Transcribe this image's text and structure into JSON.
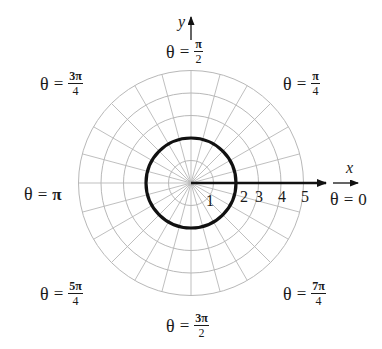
{
  "diagram": {
    "type": "polar-grid",
    "center": {
      "x": 191,
      "y": 183
    },
    "unit_px": 22.5,
    "grid_radii": [
      1,
      2,
      3,
      4,
      5
    ],
    "radial_line_step_deg": 15,
    "grid_color": "#b8b8b8",
    "curve": {
      "name": "circle",
      "equation": "r = 2",
      "radius": 2,
      "color": "#111111",
      "stroke_width": 3.2
    },
    "ray": {
      "from_r": 0,
      "to_x": 326,
      "color": "#111111",
      "stroke_width": 2.6
    },
    "axes": {
      "x": {
        "label": "x",
        "arrow_from": 333,
        "arrow_to": 358
      },
      "y": {
        "label": "y",
        "arrow_from": 40,
        "arrow_to": 17
      }
    },
    "tick_labels": [
      {
        "text": "1",
        "x": 206,
        "y": 193
      },
      {
        "text": "2",
        "x": 240,
        "y": 189
      },
      {
        "text": "3",
        "x": 255,
        "y": 189
      },
      {
        "text": "4",
        "x": 278,
        "y": 189
      },
      {
        "text": "5",
        "x": 301,
        "y": 189
      }
    ]
  },
  "angle_labels": [
    {
      "id": "theta-pi-over-2",
      "theta": "θ",
      "eq": "=",
      "type": "frac",
      "num": "π",
      "den": "2",
      "x": 166,
      "y": 38
    },
    {
      "id": "theta-pi-over-4",
      "theta": "θ",
      "eq": "=",
      "type": "frac",
      "num": "π",
      "den": "4",
      "x": 283,
      "y": 70
    },
    {
      "id": "theta-3pi-over-4",
      "theta": "θ",
      "eq": "=",
      "type": "frac",
      "num": "3π",
      "den": "4",
      "x": 40,
      "y": 70
    },
    {
      "id": "theta-pi",
      "theta": "θ",
      "eq": "=",
      "type": "plain",
      "value": "π",
      "x": 24,
      "y": 185
    },
    {
      "id": "theta-0",
      "theta": "θ",
      "eq": "=",
      "type": "plain",
      "value": "0",
      "x": 330,
      "y": 190
    },
    {
      "id": "theta-5pi-over-4",
      "theta": "θ",
      "eq": "=",
      "type": "frac",
      "num": "5π",
      "den": "4",
      "x": 40,
      "y": 280
    },
    {
      "id": "theta-7pi-over-4",
      "theta": "θ",
      "eq": "=",
      "type": "frac",
      "num": "7π",
      "den": "4",
      "x": 283,
      "y": 280
    },
    {
      "id": "theta-3pi-over-2",
      "theta": "θ",
      "eq": "=",
      "type": "frac",
      "num": "3π",
      "den": "2",
      "x": 166,
      "y": 312
    }
  ]
}
